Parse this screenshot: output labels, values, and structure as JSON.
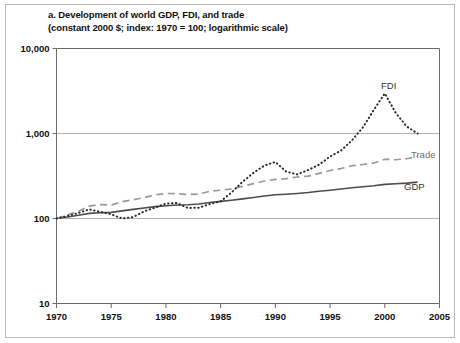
{
  "figure": {
    "title_line1": "a. Development of world GDP, FDI, and trade",
    "title_line2": "(constant 2000 $; index: 1970 = 100; logarithmic scale)"
  },
  "axes": {
    "y_ticks": [
      "10,000",
      "1,000",
      "100",
      "10"
    ],
    "x_ticks": [
      "1970",
      "1975",
      "1980",
      "1985",
      "1990",
      "1995",
      "2000",
      "2005"
    ]
  },
  "series_labels": {
    "fdi": "FDI",
    "trade": "Trade",
    "gdp": "GDP"
  },
  "colors": {
    "gdp": "#4d4d4d",
    "trade": "#9a9a9a",
    "fdi": "#2b2b2b",
    "grid": "#a8a8a8",
    "axis": "#6b6b6b",
    "frame": "#b9b9b9"
  },
  "chart_data": {
    "type": "line",
    "title": "a. Development of world GDP, FDI, and trade",
    "subtitle": "(constant 2000 $; index: 1970 = 100; logarithmic scale)",
    "xlabel": "",
    "ylabel": "",
    "yscale": "log",
    "ylim": [
      10,
      10000
    ],
    "xlim": [
      1970,
      2005
    ],
    "grid": true,
    "legend": "inline-right",
    "x": [
      1970,
      1971,
      1972,
      1973,
      1974,
      1975,
      1976,
      1977,
      1978,
      1979,
      1980,
      1981,
      1982,
      1983,
      1984,
      1985,
      1986,
      1987,
      1988,
      1989,
      1990,
      1991,
      1992,
      1993,
      1994,
      1995,
      1996,
      1997,
      1998,
      1999,
      2000,
      2001,
      2002,
      2003
    ],
    "series": [
      {
        "name": "GDP",
        "style": "solid",
        "values": [
          100,
          104,
          109,
          115,
          117,
          118,
          123,
          128,
          133,
          138,
          141,
          144,
          145,
          148,
          154,
          159,
          164,
          170,
          177,
          184,
          190,
          193,
          197,
          202,
          209,
          215,
          222,
          230,
          236,
          243,
          252,
          256,
          261,
          268
        ]
      },
      {
        "name": "Trade",
        "style": "dashed",
        "values": [
          100,
          110,
          122,
          140,
          146,
          144,
          158,
          166,
          176,
          190,
          197,
          196,
          191,
          194,
          209,
          215,
          223,
          239,
          257,
          276,
          288,
          294,
          308,
          315,
          340,
          367,
          387,
          418,
          432,
          449,
          498,
          491,
          505,
          540
        ]
      },
      {
        "name": "FDI",
        "style": "dotted",
        "values": [
          100,
          107,
          116,
          128,
          120,
          112,
          100,
          104,
          121,
          134,
          150,
          152,
          133,
          134,
          148,
          159,
          203,
          270,
          345,
          420,
          462,
          356,
          330,
          372,
          430,
          537,
          630,
          830,
          1180,
          1900,
          2960,
          1750,
          1210,
          1000
        ]
      }
    ]
  }
}
